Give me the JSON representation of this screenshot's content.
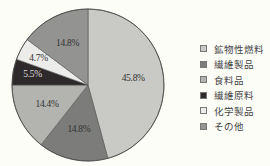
{
  "chart_data": {
    "type": "pie",
    "title": "",
    "start_angle_deg": 0,
    "direction": "clockwise",
    "center": [
      88,
      85
    ],
    "radius": 76,
    "slices": [
      {
        "label": "鉱物性燃料",
        "value": 45.8,
        "value_label": "45.8%",
        "color": "#c9c9c6"
      },
      {
        "label": "繊維製品",
        "value": 14.8,
        "value_label": "14.8%",
        "color": "#7c7c7a"
      },
      {
        "label": "食料品",
        "value": 14.4,
        "value_label": "14.4%",
        "color": "#b3b3b0"
      },
      {
        "label": "繊維原料",
        "value": 5.5,
        "value_label": "5.5%",
        "color": "#2e2a2b"
      },
      {
        "label": "化学製品",
        "value": 4.7,
        "value_label": "4.7%",
        "color": "#ececea"
      },
      {
        "label": "その他",
        "value": 14.8,
        "value_label": "14.8%",
        "color": "#939391"
      }
    ],
    "legend_position": "right",
    "unit": "%"
  },
  "legend": {
    "items": [
      {
        "label": "鉱物性燃料",
        "color": "#c9c9c6"
      },
      {
        "label": "繊維製品",
        "color": "#7c7c7a"
      },
      {
        "label": "食料品",
        "color": "#b3b3b0"
      },
      {
        "label": "繊維原料",
        "color": "#2e2a2b"
      },
      {
        "label": "化学製品",
        "color": "#ececea"
      },
      {
        "label": "その他",
        "color": "#939391"
      }
    ]
  }
}
